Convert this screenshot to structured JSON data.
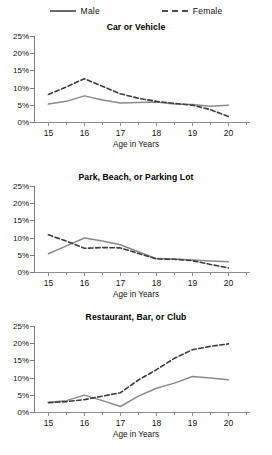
{
  "legend": {
    "male_label": "Male",
    "female_label": "Female"
  },
  "axis": {
    "caption": "Age in Years",
    "y_ticks": [
      "25%",
      "20%",
      "15%",
      "10%",
      "5%",
      "0%"
    ],
    "x_ticks": [
      "15",
      "16",
      "17",
      "18",
      "19",
      "20"
    ]
  },
  "colors": {
    "male_line": "#8a8a8a",
    "female_line": "#3d3d3d",
    "axis": "#7a7a7a",
    "background": "#ffffff"
  },
  "chart_data": [
    {
      "type": "line",
      "title": "Car or Vehicle",
      "xlabel": "Age in Years",
      "ylabel": "",
      "xlim": [
        14.6,
        20.6
      ],
      "ylim": [
        0,
        25
      ],
      "ytick_values": [
        25,
        20,
        15,
        10,
        5,
        0
      ],
      "xtick_values": [
        15,
        16,
        17,
        18,
        19,
        20
      ],
      "grid": false,
      "legend_position": "top",
      "x": [
        15,
        15.5,
        16,
        16.5,
        17,
        17.5,
        18,
        18.5,
        19,
        19.5,
        20
      ],
      "series": [
        {
          "name": "Male",
          "style": "solid",
          "values": [
            5.2,
            6.0,
            7.6,
            6.4,
            5.5,
            5.7,
            5.8,
            5.2,
            5.1,
            4.6,
            4.9
          ]
        },
        {
          "name": "Female",
          "style": "dashed",
          "values": [
            8.0,
            10.2,
            12.6,
            10.4,
            8.2,
            6.9,
            6.0,
            5.4,
            4.9,
            3.6,
            1.6
          ]
        }
      ]
    },
    {
      "type": "line",
      "title": "Park, Beach, or Parking Lot",
      "xlabel": "Age in Years",
      "ylabel": "",
      "xlim": [
        14.6,
        20.6
      ],
      "ylim": [
        0,
        25
      ],
      "ytick_values": [
        25,
        20,
        15,
        10,
        5,
        0
      ],
      "xtick_values": [
        15,
        16,
        17,
        18,
        19,
        20
      ],
      "grid": false,
      "legend_position": "top",
      "x": [
        15,
        15.5,
        16,
        16.5,
        17,
        17.5,
        18,
        18.5,
        19,
        19.5,
        20
      ],
      "series": [
        {
          "name": "Male",
          "style": "solid",
          "values": [
            5.3,
            7.6,
            9.9,
            9.0,
            7.9,
            5.9,
            3.9,
            3.8,
            3.5,
            3.2,
            3.0
          ]
        },
        {
          "name": "Female",
          "style": "dashed",
          "values": [
            10.8,
            9.0,
            6.9,
            7.1,
            7.0,
            5.4,
            3.8,
            3.7,
            3.3,
            2.2,
            1.2
          ]
        }
      ]
    },
    {
      "type": "line",
      "title": "Restaurant, Bar, or Club",
      "xlabel": "Age in Years",
      "ylabel": "",
      "xlim": [
        14.6,
        20.6
      ],
      "ylim": [
        0,
        25
      ],
      "ytick_values": [
        25,
        20,
        15,
        10,
        5,
        0
      ],
      "xtick_values": [
        15,
        16,
        17,
        18,
        19,
        20
      ],
      "grid": false,
      "legend_position": "top",
      "x": [
        15,
        15.5,
        16,
        16.5,
        17,
        17.5,
        18,
        18.5,
        19,
        19.5,
        20
      ],
      "series": [
        {
          "name": "Male",
          "style": "solid",
          "values": [
            2.8,
            3.3,
            4.9,
            3.3,
            1.6,
            4.6,
            6.9,
            8.4,
            10.3,
            9.9,
            9.4
          ]
        },
        {
          "name": "Female",
          "style": "dashed",
          "values": [
            2.7,
            3.0,
            3.6,
            4.6,
            5.6,
            9.3,
            12.3,
            15.6,
            18.1,
            19.1,
            19.8
          ]
        }
      ]
    }
  ]
}
